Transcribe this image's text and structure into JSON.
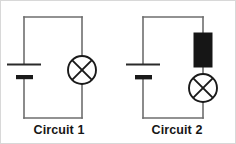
{
  "figure": {
    "title": "",
    "background_color": "#ffffff",
    "border_color": "#d8d8d8",
    "wire_color": "#6e6e6e",
    "component_color": "#161616",
    "resistor_fill": "#161616"
  },
  "circuits": [
    {
      "id": "circuit-1",
      "caption": "Circuit 1",
      "components": [
        {
          "type": "battery",
          "name": "battery",
          "position": "left-branch"
        },
        {
          "type": "lamp",
          "name": "lamp",
          "symbol": "circle-with-x",
          "position": "right-branch"
        }
      ],
      "loop": {
        "x1": 24,
        "y1": 17,
        "x2": 82,
        "y2": 118
      }
    },
    {
      "id": "circuit-2",
      "caption": "Circuit 2",
      "components": [
        {
          "type": "battery",
          "name": "battery",
          "position": "left-branch"
        },
        {
          "type": "resistor",
          "name": "resistor",
          "symbol": "filled-rectangle",
          "position": "right-branch-upper"
        },
        {
          "type": "lamp",
          "name": "lamp",
          "symbol": "circle-with-x",
          "position": "right-branch-lower"
        }
      ],
      "loop": {
        "x1": 25,
        "y1": 17,
        "x2": 85,
        "y2": 118
      }
    }
  ]
}
